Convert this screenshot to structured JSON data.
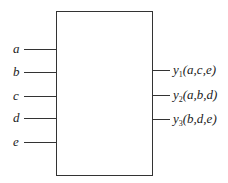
{
  "diagram": {
    "type": "block-diagram",
    "block": {
      "label": ""
    },
    "inputs": [
      {
        "name": "a"
      },
      {
        "name": "b"
      },
      {
        "name": "c"
      },
      {
        "name": "d"
      },
      {
        "name": "e"
      }
    ],
    "outputs": [
      {
        "name": "y",
        "subscript": "1",
        "args": "(a,c,e)"
      },
      {
        "name": "y",
        "subscript": "2",
        "args": "(a,b,d)"
      },
      {
        "name": "y",
        "subscript": "3",
        "args": "(b,d,e)"
      }
    ]
  }
}
